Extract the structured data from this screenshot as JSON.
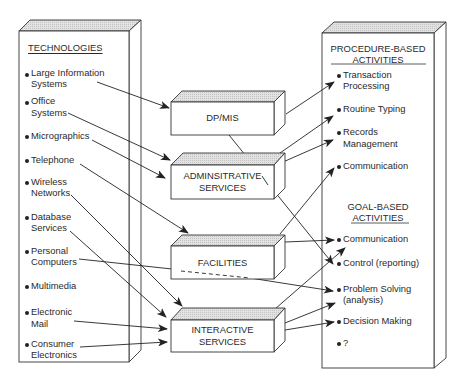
{
  "diagram": {
    "left_panel": {
      "title": "TECHNOLOGIES",
      "items": [
        {
          "line1": "Large Information",
          "line2": "Systems"
        },
        {
          "line1": "Office",
          "line2": "Systems"
        },
        {
          "line1": "Micrographics",
          "line2": ""
        },
        {
          "line1": "Telephone",
          "line2": ""
        },
        {
          "line1": "Wireless",
          "line2": "Networks"
        },
        {
          "line1": "Database",
          "line2": "Services"
        },
        {
          "line1": "Personal",
          "line2": "Computers"
        },
        {
          "line1": "Multimedia",
          "line2": ""
        },
        {
          "line1": "Electronic",
          "line2": "Mail"
        },
        {
          "line1": "Consumer",
          "line2": "Electronics"
        }
      ]
    },
    "middle_boxes": [
      {
        "line1": "DP/MIS",
        "line2": ""
      },
      {
        "line1": "ADMINSITRATIVE",
        "line2": "SERVICES"
      },
      {
        "line1": "FACILITIES",
        "line2": ""
      },
      {
        "line1": "INTERACTIVE",
        "line2": "SERVICES"
      }
    ],
    "right_panel": {
      "procedure_title_1": "PROCEDURE-BASED",
      "procedure_title_2": "ACTIVITIES",
      "procedure_items": [
        {
          "line1": "Transaction",
          "line2": "Processing"
        },
        {
          "line1": "Routine Typing",
          "line2": ""
        },
        {
          "line1": "Records",
          "line2": "Management"
        },
        {
          "line1": "Communication",
          "line2": ""
        }
      ],
      "goal_title_1": "GOAL-BASED",
      "goal_title_2": "ACTIVITIES",
      "goal_items": [
        {
          "line1": "Communication",
          "line2": ""
        },
        {
          "line1": "Control (reporting)",
          "line2": ""
        },
        {
          "line1": "Problem Solving",
          "line2": "(analysis)"
        },
        {
          "line1": "Decision Making",
          "line2": ""
        },
        {
          "line1": "?",
          "line2": ""
        }
      ]
    },
    "connections": [
      {
        "from": "Large Information Systems",
        "to": "DP/MIS"
      },
      {
        "from": "Office Systems",
        "to": "ADMINSITRATIVE SERVICES"
      },
      {
        "from": "Micrographics",
        "to": "ADMINSITRATIVE SERVICES"
      },
      {
        "from": "Telephone",
        "to": "FACILITIES"
      },
      {
        "from": "Wireless Networks",
        "to": "INTERACTIVE SERVICES"
      },
      {
        "from": "Database Services",
        "to": "INTERACTIVE SERVICES"
      },
      {
        "from": "Personal Computers",
        "to": "Problem Solving (analysis)",
        "style": "dashed-behind-facilities"
      },
      {
        "from": "Electronic Mail",
        "to": "INTERACTIVE SERVICES"
      },
      {
        "from": "Consumer Electronics",
        "to": "INTERACTIVE SERVICES"
      },
      {
        "from": "DP/MIS",
        "to": "Transaction Processing"
      },
      {
        "from": "DP/MIS",
        "to": "Control (reporting)"
      },
      {
        "from": "ADMINSITRATIVE SERVICES",
        "to": "Routine Typing"
      },
      {
        "from": "ADMINSITRATIVE SERVICES",
        "to": "Records Management"
      },
      {
        "from": "FACILITIES",
        "to": "Communication (procedure)"
      },
      {
        "from": "FACILITIES",
        "to": "Communication (goal)"
      },
      {
        "from": "INTERACTIVE SERVICES",
        "to": "Communication (goal)"
      },
      {
        "from": "INTERACTIVE SERVICES",
        "to": "Problem Solving (analysis)"
      },
      {
        "from": "INTERACTIVE SERVICES",
        "to": "Decision Making"
      }
    ]
  }
}
